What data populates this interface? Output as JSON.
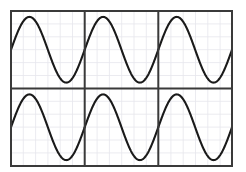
{
  "canvas": {
    "width": 246,
    "height": 172,
    "background_color": "#ffffff"
  },
  "figure": {
    "name": "sine-wave-grid-figure",
    "plot_area": {
      "x": 11,
      "y": 11,
      "width": 221,
      "height": 155
    },
    "border_color": "#3a3a3a",
    "border_width": 2,
    "grid": {
      "visible": true,
      "minor_color": "#e6e6ec",
      "minor_width": 0.8,
      "minor_spacing_x": 12.3,
      "minor_spacing_y": 12.9,
      "divider_color": "#3a3a3a",
      "divider_width": 2,
      "columns": 3,
      "rows": 2,
      "column_dividers_x": [
        84.7,
        158.3
      ],
      "row_dividers_y": [
        88.5
      ]
    },
    "curve": {
      "color": "#1a1a1a",
      "width": 2.1,
      "samples": 180
    }
  },
  "chart_data": {
    "type": "line",
    "title": "",
    "subtitle": "",
    "xlabel": "",
    "ylabel": "",
    "legend": [],
    "annotations": [],
    "grid": true,
    "legend_position": "none",
    "panel_layout": {
      "rows": 2,
      "cols": 3,
      "shared_x": true,
      "shared_y": true,
      "tick_labels_x": [],
      "tick_labels_y": []
    },
    "function": "y = sin(2*pi*x)",
    "period_per_panel": 1,
    "amplitude": 1,
    "xlim": [
      0,
      1
    ],
    "ylim": [
      -1.18,
      1.18
    ],
    "panels": [
      {
        "id": "panel-r1c1",
        "row": 0,
        "col": 0,
        "series": [
          {
            "name": "sine",
            "phase": 0,
            "x": [
              0,
              0.0625,
              0.125,
              0.1875,
              0.25,
              0.3125,
              0.375,
              0.4375,
              0.5,
              0.5625,
              0.625,
              0.6875,
              0.75,
              0.8125,
              0.875,
              0.9375,
              1
            ],
            "values": [
              0,
              0.383,
              0.707,
              0.924,
              1,
              0.924,
              0.707,
              0.383,
              0,
              -0.383,
              -0.707,
              -0.924,
              -1,
              -0.924,
              -0.707,
              -0.383,
              0
            ]
          }
        ]
      },
      {
        "id": "panel-r1c2",
        "row": 0,
        "col": 1,
        "series": [
          {
            "name": "sine",
            "phase": 0,
            "x": [
              0,
              0.0625,
              0.125,
              0.1875,
              0.25,
              0.3125,
              0.375,
              0.4375,
              0.5,
              0.5625,
              0.625,
              0.6875,
              0.75,
              0.8125,
              0.875,
              0.9375,
              1
            ],
            "values": [
              0,
              0.383,
              0.707,
              0.924,
              1,
              0.924,
              0.707,
              0.383,
              0,
              -0.383,
              -0.707,
              -0.924,
              -1,
              -0.924,
              -0.707,
              -0.383,
              0
            ]
          }
        ]
      },
      {
        "id": "panel-r1c3",
        "row": 0,
        "col": 2,
        "series": [
          {
            "name": "sine",
            "phase": 0,
            "x": [
              0,
              0.0625,
              0.125,
              0.1875,
              0.25,
              0.3125,
              0.375,
              0.4375,
              0.5,
              0.5625,
              0.625,
              0.6875,
              0.75,
              0.8125,
              0.875,
              0.9375,
              1
            ],
            "values": [
              0,
              0.383,
              0.707,
              0.924,
              1,
              0.924,
              0.707,
              0.383,
              0,
              -0.383,
              -0.707,
              -0.924,
              -1,
              -0.924,
              -0.707,
              -0.383,
              0
            ]
          }
        ]
      },
      {
        "id": "panel-r2c1",
        "row": 1,
        "col": 0,
        "series": [
          {
            "name": "sine",
            "phase": 0,
            "x": [
              0,
              0.0625,
              0.125,
              0.1875,
              0.25,
              0.3125,
              0.375,
              0.4375,
              0.5,
              0.5625,
              0.625,
              0.6875,
              0.75,
              0.8125,
              0.875,
              0.9375,
              1
            ],
            "values": [
              0,
              0.383,
              0.707,
              0.924,
              1,
              0.924,
              0.707,
              0.383,
              0,
              -0.383,
              -0.707,
              -0.924,
              -1,
              -0.924,
              -0.707,
              -0.383,
              0
            ]
          }
        ]
      },
      {
        "id": "panel-r2c2",
        "row": 1,
        "col": 1,
        "series": [
          {
            "name": "sine",
            "phase": 0,
            "x": [
              0,
              0.0625,
              0.125,
              0.1875,
              0.25,
              0.3125,
              0.375,
              0.4375,
              0.5,
              0.5625,
              0.625,
              0.6875,
              0.75,
              0.8125,
              0.875,
              0.9375,
              1
            ],
            "values": [
              0,
              0.383,
              0.707,
              0.924,
              1,
              0.924,
              0.707,
              0.383,
              0,
              -0.383,
              -0.707,
              -0.924,
              -1,
              -0.924,
              -0.707,
              -0.383,
              0
            ]
          }
        ]
      },
      {
        "id": "panel-r2c3",
        "row": 1,
        "col": 2,
        "series": [
          {
            "name": "sine",
            "phase": 0,
            "x": [
              0,
              0.0625,
              0.125,
              0.1875,
              0.25,
              0.3125,
              0.375,
              0.4375,
              0.5,
              0.5625,
              0.625,
              0.6875,
              0.75,
              0.8125,
              0.875,
              0.9375,
              1
            ],
            "values": [
              0,
              0.383,
              0.707,
              0.924,
              1,
              0.924,
              0.707,
              0.383,
              0,
              -0.383,
              -0.707,
              -0.924,
              -1,
              -0.924,
              -0.707,
              -0.383,
              0
            ]
          }
        ]
      }
    ]
  }
}
